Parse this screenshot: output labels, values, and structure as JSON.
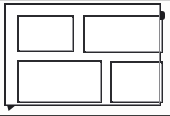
{
  "figure": {
    "title": "",
    "caption": "",
    "type": "line-drawing",
    "background_color": "#fdfdfc",
    "stroke_color": "#26262a",
    "fill_color": "#ffffff",
    "outer_frame": {
      "label": "",
      "x": 4,
      "y": 3,
      "width": 157,
      "height": 103
    },
    "panels": [
      {
        "name": "panel-top-left",
        "label": "",
        "x": 11,
        "y": 10,
        "width": 57,
        "height": 37
      },
      {
        "name": "panel-top-right",
        "label": "",
        "x": 77,
        "y": 10,
        "width": 80,
        "height": 38
      },
      {
        "name": "panel-bottom-left",
        "label": "",
        "x": 11,
        "y": 55,
        "width": 85,
        "height": 43
      },
      {
        "name": "panel-bottom-right",
        "label": "",
        "x": 104,
        "y": 56,
        "width": 53,
        "height": 42
      }
    ],
    "markers": [
      {
        "name": "tab-right-edge",
        "label": "",
        "x": 160,
        "y": 11,
        "width": 5,
        "height": 9
      },
      {
        "name": "tab-bottom-left",
        "label": "",
        "x": 7,
        "y": 105,
        "width": 9,
        "height": 6
      }
    ]
  }
}
